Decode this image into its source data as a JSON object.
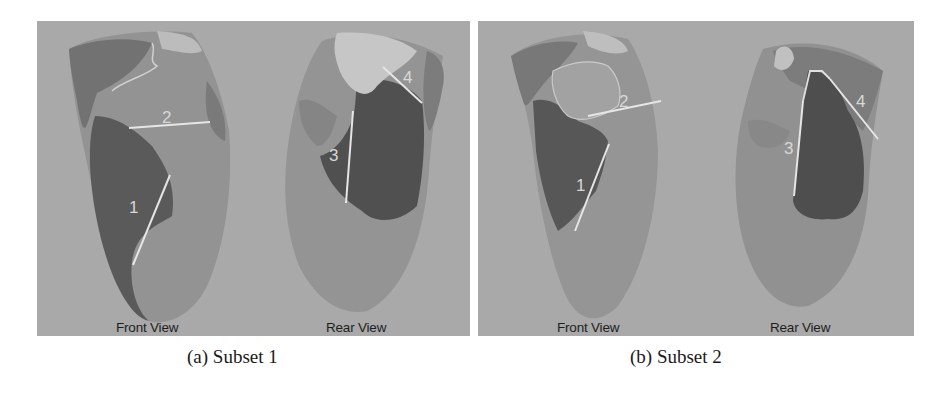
{
  "figure": {
    "subfigures": [
      {
        "id": "a",
        "caption": "(a) Subset 1",
        "views": [
          {
            "label": "Front View",
            "markers": [
              "1",
              "2"
            ]
          },
          {
            "label": "Rear View",
            "markers": [
              "3",
              "4"
            ]
          }
        ]
      },
      {
        "id": "b",
        "caption": "(b) Subset 2",
        "views": [
          {
            "label": "Front View",
            "markers": [
              "1",
              "2"
            ]
          },
          {
            "label": "Rear View",
            "markers": [
              "3",
              "4"
            ]
          }
        ]
      }
    ],
    "colors": {
      "background": "#a9a9a9",
      "surface_light": "#9a9a9a",
      "surface_mid": "#808080",
      "region_dark": "#505050",
      "region_pale": "#c4c4c4",
      "marker_line": "#e6e6e6"
    }
  }
}
